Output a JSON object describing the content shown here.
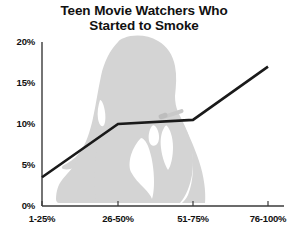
{
  "chart_data": {
    "type": "line",
    "title": "Teen Movie Watchers Who Started to Smoke",
    "title_lines": [
      "Teen Movie Watchers Who",
      "Started to Smoke"
    ],
    "xlabel": "",
    "ylabel": "",
    "categories": [
      "1-25%",
      "26-50%",
      "51-75%",
      "76-100%"
    ],
    "values": [
      3.5,
      10,
      10.5,
      17
    ],
    "series": [
      {
        "name": "Started to Smoke",
        "values": [
          3.5,
          10,
          10.5,
          17
        ]
      }
    ],
    "ylim": [
      0,
      20
    ],
    "yticks": [
      0,
      5,
      10,
      15,
      20
    ],
    "ytick_labels": [
      "0%",
      "5%",
      "10%",
      "15%",
      "20%"
    ],
    "xtick_labels": [
      "1-25%",
      "26-50%",
      "51-75%",
      "76-100%"
    ],
    "grid": false,
    "legend": false,
    "line_color": "#1a1a1a",
    "axis_color": "#3a3a3a",
    "background_color": "#ffffff",
    "watermark_color": "#d4d4d4",
    "watermark_name": "teen-smoking-silhouette"
  }
}
